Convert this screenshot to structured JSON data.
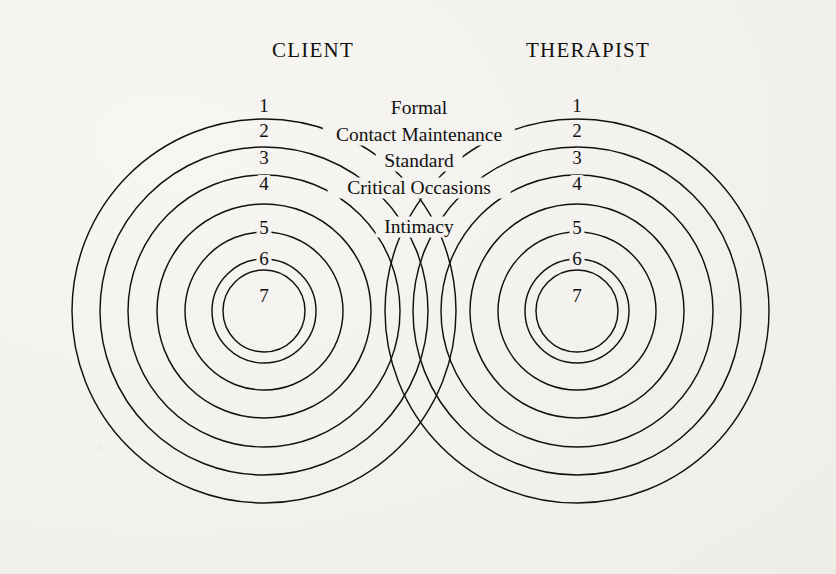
{
  "figure": {
    "background_color": "#f2f1ed",
    "ink_color": "#12110f",
    "width": 836,
    "height": 574
  },
  "headings": [
    {
      "id": "client",
      "label": "CLIENT",
      "x": 313,
      "y": 52
    },
    {
      "id": "therapist",
      "label": "THERAPIST",
      "x": 588,
      "y": 52
    }
  ],
  "center_labels": [
    {
      "id": "formal",
      "label": "Formal",
      "x": 419,
      "y": 108
    },
    {
      "id": "contact-maintenance",
      "label": "Contact Maintenance",
      "x": 419,
      "y": 135
    },
    {
      "id": "standard",
      "label": "Standard",
      "x": 419,
      "y": 161
    },
    {
      "id": "critical-occasions",
      "label": "Critical Occasions",
      "x": 419,
      "y": 188
    },
    {
      "id": "intimacy",
      "label": "Intimacy",
      "x": 419,
      "y": 227
    }
  ],
  "groups": [
    {
      "id": "client",
      "name": "CLIENT",
      "cx": 264,
      "cy": 311,
      "num_x": 264,
      "radii": [
        192,
        164,
        136,
        107,
        79,
        52,
        41
      ],
      "rings": [
        {
          "number": "1",
          "level_label": "Formal",
          "y": 105
        },
        {
          "number": "2",
          "level_label": "Contact Maintenance",
          "y": 130
        },
        {
          "number": "3",
          "level_label": "Standard",
          "y": 157
        },
        {
          "number": "4",
          "level_label": "Critical Occasions",
          "y": 183
        },
        {
          "number": "5",
          "level_label": "Intimacy",
          "y": 227
        },
        {
          "number": "6",
          "level_label": "",
          "y": 258
        },
        {
          "number": "7",
          "level_label": "",
          "y": 295
        }
      ]
    },
    {
      "id": "therapist",
      "name": "THERAPIST",
      "cx": 577,
      "cy": 311,
      "num_x": 577,
      "radii": [
        192,
        164,
        136,
        107,
        79,
        52,
        41
      ],
      "rings": [
        {
          "number": "1",
          "level_label": "Formal",
          "y": 105
        },
        {
          "number": "2",
          "level_label": "Contact Maintenance",
          "y": 130
        },
        {
          "number": "3",
          "level_label": "Standard",
          "y": 157
        },
        {
          "number": "4",
          "level_label": "Critical Occasions",
          "y": 183
        },
        {
          "number": "5",
          "level_label": "Intimacy",
          "y": 227
        },
        {
          "number": "6",
          "level_label": "",
          "y": 258
        },
        {
          "number": "7",
          "level_label": "",
          "y": 295
        }
      ]
    }
  ],
  "chart_data": {
    "type": "diagram",
    "subtype": "concentric-circles-overlap",
    "title": "",
    "levels": [
      {
        "number": 1,
        "label": "Formal"
      },
      {
        "number": 2,
        "label": "Contact Maintenance"
      },
      {
        "number": 3,
        "label": "Standard"
      },
      {
        "number": 4,
        "label": "Critical Occasions"
      },
      {
        "number": 5,
        "label": "Intimacy"
      },
      {
        "number": 6,
        "label": ""
      },
      {
        "number": 7,
        "label": ""
      }
    ],
    "actors": [
      "CLIENT",
      "THERAPIST"
    ]
  }
}
